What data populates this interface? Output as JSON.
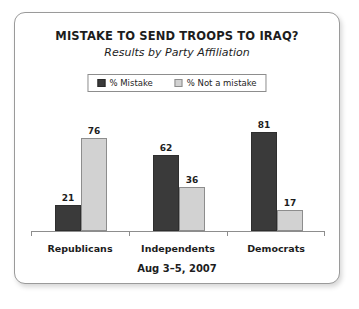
{
  "card": {
    "border_color": "#9a9a9a",
    "background": "#ffffff"
  },
  "chart_data": {
    "type": "bar",
    "title": "MISTAKE TO SEND TROOPS TO IRAQ?",
    "subtitle": "Results by Party Affiliation",
    "footer": "Aug 3–5, 2007",
    "categories": [
      "Republicans",
      "Independents",
      "Democrats"
    ],
    "series": [
      {
        "name": "% Mistake",
        "color": "#3a3a3a",
        "values": [
          21,
          62,
          81
        ]
      },
      {
        "name": "% Not a mistake",
        "color": "#d2d2d2",
        "values": [
          76,
          36,
          17
        ]
      }
    ],
    "xlabel": "",
    "ylabel": "",
    "ylim": [
      0,
      100
    ],
    "grid": false,
    "legend_position": "top-center",
    "value_labels": true
  }
}
